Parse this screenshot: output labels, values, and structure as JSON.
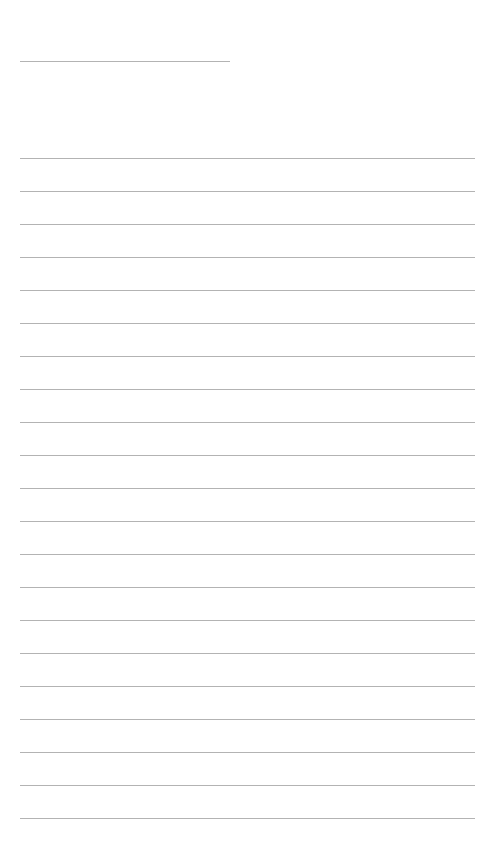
{
  "page": {
    "type": "lined-paper",
    "background": "#ffffff",
    "line_color": "#9a9a9a",
    "title_line": {
      "y": 61,
      "x": 20,
      "width": 210
    },
    "ruled_lines": {
      "count": 21,
      "start_y": 158,
      "spacing": 33,
      "x": 20,
      "width": 455
    }
  }
}
